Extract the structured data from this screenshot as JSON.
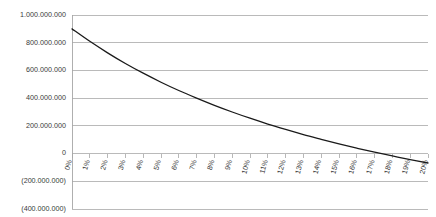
{
  "chart_data": {
    "type": "line",
    "title": "",
    "subtitle": "",
    "xlabel": "",
    "ylabel": "",
    "grid": "horizontal",
    "legend": "none",
    "xlim": [
      0,
      20
    ],
    "ylim": [
      -400000000,
      1000000000
    ],
    "categories": [
      "0%",
      "1%",
      "2%",
      "3%",
      "4%",
      "5%",
      "6%",
      "7%",
      "8%",
      "9%",
      "10%",
      "11%",
      "12%",
      "13%",
      "14%",
      "15%",
      "16%",
      "17%",
      "18%",
      "19%",
      "20%"
    ],
    "x": [
      0,
      1,
      2,
      3,
      4,
      5,
      6,
      7,
      8,
      9,
      10,
      11,
      12,
      13,
      14,
      15,
      16,
      17,
      18,
      19,
      20
    ],
    "series": [
      {
        "name": "Net Present Value",
        "values": [
          900000000,
          810000000,
          727000000,
          650000000,
          580000000,
          515000000,
          455000000,
          400000000,
          348000000,
          300000000,
          255000000,
          213000000,
          174000000,
          137000000,
          103000000,
          70000000,
          39000000,
          10000000,
          -17000000,
          -43000000,
          -68000000
        ],
        "color": "#1a1a1a"
      }
    ],
    "ytick_values": [
      1000000000,
      800000000,
      600000000,
      400000000,
      200000000,
      0,
      -200000000,
      -400000000
    ],
    "ytick_labels": [
      "1.000.000.000",
      "800.000.000",
      "600.000.000",
      "400.000.000",
      "200.000.000",
      "0",
      "(200.000.000)",
      "(400.000.000)"
    ],
    "xtick_labels": [
      "0%",
      "1%",
      "2%",
      "3%",
      "4%",
      "5%",
      "6%",
      "7%",
      "8%",
      "9%",
      "10%",
      "11%",
      "12%",
      "13%",
      "14%",
      "15%",
      "16%",
      "17%",
      "18%",
      "19%",
      "20%"
    ],
    "zero_crossing": "13.5%",
    "colors": {
      "gridline": "#b3b3b3",
      "axis": "#a6a6a6",
      "series": "#1a1a1a",
      "text": "#3a3a3a",
      "background": "#ffffff"
    },
    "xtick_label_rotation": -75
  }
}
